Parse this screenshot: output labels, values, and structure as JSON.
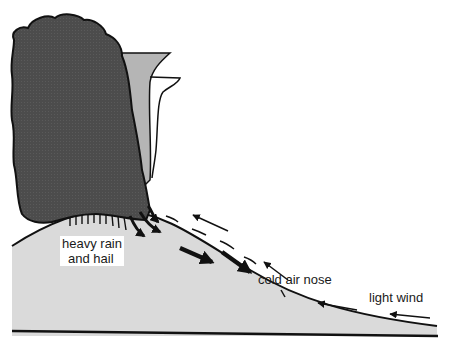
{
  "diagram": {
    "type": "thunderstorm-downdraft-cross-section",
    "labels": {
      "rain": [
        "heavy rain",
        "and hail"
      ],
      "cold_air_nose": "cold air nose",
      "light_wind": "light wind"
    },
    "colors": {
      "cloud": "#4a4a4a",
      "anvil": "#b3b3b3",
      "cold_air": "#d9d9d9",
      "outline": "#111111",
      "background": "#ffffff"
    },
    "elements": [
      "cumulonimbus-cloud",
      "anvil",
      "cold-air-dome",
      "downdraft-arrows",
      "return-flow-arrows",
      "ground-line"
    ]
  }
}
